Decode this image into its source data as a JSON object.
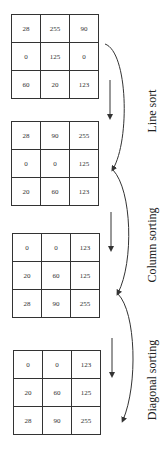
{
  "diagram": {
    "matrices": [
      {
        "name": "original",
        "rows": [
          [
            "28",
            "255",
            "90"
          ],
          [
            "0",
            "125",
            "0"
          ],
          [
            "60",
            "20",
            "123"
          ]
        ]
      },
      {
        "name": "after-line-sort",
        "rows": [
          [
            "28",
            "90",
            "255"
          ],
          [
            "0",
            "0",
            "125"
          ],
          [
            "20",
            "60",
            "123"
          ]
        ]
      },
      {
        "name": "after-column-sorting",
        "rows": [
          [
            "0",
            "0",
            "123"
          ],
          [
            "20",
            "60",
            "125"
          ],
          [
            "28",
            "90",
            "255"
          ]
        ]
      },
      {
        "name": "after-diagonal-sorting",
        "rows": [
          [
            "0",
            "0",
            "123"
          ],
          [
            "20",
            "60",
            "125"
          ],
          [
            "28",
            "90",
            "255"
          ]
        ]
      }
    ],
    "steps": [
      {
        "label": "Line sort"
      },
      {
        "label": "Column sorting"
      },
      {
        "label": "Diagonal sorting"
      }
    ],
    "colors": {
      "line": "#333333",
      "background": "#ffffff"
    }
  }
}
